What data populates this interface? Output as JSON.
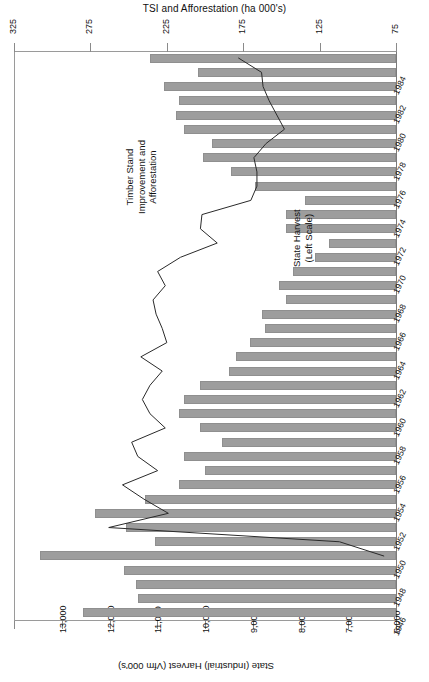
{
  "chart_data": {
    "type": "bar",
    "title": "TSI and Afforestation (ha 000's)",
    "xlabel": "State (Industrial) Harvest (Vfm 000's)",
    "ylabel": "",
    "orientation": "horizontal",
    "grid": false,
    "legend_position": "inline-annotations",
    "categories": [
      "1946",
      "1947",
      "1948",
      "1949",
      "1950",
      "1951",
      "1952",
      "1953",
      "1954",
      "1955",
      "1956",
      "1957",
      "1958",
      "1959",
      "1960",
      "1961",
      "1962",
      "1963",
      "1964",
      "1965",
      "1966",
      "1967",
      "1968",
      "1969",
      "1970",
      "1971",
      "1972",
      "1973",
      "1974",
      "1975",
      "1976",
      "1977",
      "1978",
      "1979",
      "1980",
      "1981",
      "1982",
      "1983",
      "1984",
      "1985"
    ],
    "tick_labels_shown": [
      "1946",
      "1948",
      "1950",
      "1952",
      "1954",
      "1956",
      "1958",
      "1960",
      "1962",
      "1964",
      "1966",
      "1968",
      "1970",
      "1972",
      "1974",
      "1976",
      "1978",
      "1980",
      "1982",
      "1984"
    ],
    "series": [
      {
        "name": "State Harvest (Left Scale)",
        "type": "bar",
        "axis": "bottom",
        "unit": "Vfm 000's",
        "values": [
          12550,
          11400,
          11450,
          11700,
          13450,
          11050,
          11650,
          12300,
          11250,
          10550,
          10000,
          10450,
          9650,
          10100,
          10550,
          10450,
          10100,
          9500,
          9350,
          9050,
          8750,
          8800,
          8300,
          8450,
          8150,
          7700,
          7400,
          8300,
          8300,
          7900,
          8950,
          9450,
          10050,
          9850,
          10450,
          10600,
          10550,
          10850,
          10150,
          11150
        ]
      },
      {
        "name": "Timber Stand Improvement and Afforestation",
        "type": "line",
        "axis": "top",
        "unit": "ha 000's",
        "values": [
          null,
          null,
          null,
          null,
          83,
          112,
          263,
          224,
          240,
          254,
          231,
          244,
          248,
          226,
          236,
          241,
          236,
          228,
          242,
          225,
          228,
          232,
          234,
          226,
          231,
          216,
          192,
          203,
          202,
          170,
          166,
          166,
          168,
          160,
          148,
          153,
          158,
          162,
          163,
          178
        ]
      }
    ],
    "axes": {
      "top": {
        "label": "TSI and Afforestation (ha 000's)",
        "ticks": [
          "325",
          "275",
          "225",
          "175",
          "125",
          "75"
        ],
        "tick_values": [
          325,
          275,
          225,
          175,
          125,
          75
        ],
        "range": [
          325,
          75
        ],
        "reversed": true
      },
      "bottom": {
        "label": "State (Industrial) Harvest (Vfm 000's)",
        "ticks": [
          "",
          "13,000",
          "12,000",
          "11,000",
          "10,000",
          "9,000",
          "8,000",
          "7,000",
          "6,000"
        ],
        "tick_values": [
          14000,
          13000,
          12000,
          11000,
          10000,
          9000,
          8000,
          7000,
          6000
        ],
        "range": [
          14000,
          6000
        ],
        "reversed": true
      }
    },
    "annotations": [
      {
        "id": "tsi",
        "lines": [
          "Timber Stand",
          "Improvement and",
          "Afforestation"
        ]
      },
      {
        "id": "harvest",
        "lines": [
          "State Harvest",
          "(Left Scale)"
        ]
      }
    ],
    "colors": {
      "bar_fill": "#9d9d9d",
      "bar_stroke": "#8f8f8f",
      "line_stroke": "#2a2a2a",
      "axis": "#8a8a8a",
      "text": "#111111",
      "background": "#ffffff"
    }
  },
  "title": {
    "text": "TSI and Afforestation (ha 000's)"
  },
  "bottom_axis_title": {
    "text": "State (Industrial) Harvest (Vfm 000's)"
  },
  "annotation_tsi": {
    "l1": "Timber Stand",
    "l2": "Improvement and",
    "l3": "Afforestation"
  },
  "annotation_harvest": {
    "l1": "State Harvest",
    "l2": "(Left Scale)"
  }
}
